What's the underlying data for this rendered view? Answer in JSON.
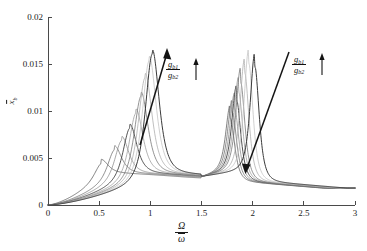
{
  "figure": {
    "title": "",
    "background_color": "#ffffff",
    "axis_color": "#4a4a4a"
  },
  "axes": {
    "x": {
      "label_numerator": "Ω",
      "label_denominator": "ω",
      "ticks": [
        "0",
        "0.5",
        "1",
        "1.5",
        "2",
        "2.5",
        "3"
      ],
      "tick_values": [
        0,
        0.5,
        1,
        1.5,
        2,
        2.5,
        3
      ],
      "min": 0,
      "max": 3
    },
    "y": {
      "label_base": "x",
      "label_sub": "b",
      "ticks": [
        "0",
        "0.005",
        "0.01",
        "0.015",
        "0.02"
      ],
      "tick_values": [
        0,
        0.005,
        0.01,
        0.015,
        0.02
      ],
      "min": 0,
      "max": 0.02
    }
  },
  "annotations": [
    {
      "id": "left-trend",
      "numerator": "g",
      "numerator_sub": "b1",
      "denominator": "g",
      "denominator_sub": "b2",
      "direction": "increasing",
      "arrow_glyph": "↑"
    },
    {
      "id": "right-trend",
      "numerator": "g",
      "numerator_sub": "b1",
      "denominator": "g",
      "denominator_sub": "b2",
      "direction": "increasing",
      "arrow_glyph": "↑"
    }
  ],
  "chart_data": {
    "type": "line",
    "title": "",
    "xlabel": "Ω/ω",
    "ylabel": "x̄_b",
    "xlim": [
      0,
      3
    ],
    "ylim": [
      0,
      0.02
    ],
    "grid": false,
    "legend": "none",
    "x": [
      0,
      0.1,
      0.2,
      0.3,
      0.4,
      0.5,
      0.6,
      0.7,
      0.8,
      0.9,
      1.0,
      1.1,
      1.2,
      1.3,
      1.4,
      1.5,
      1.6,
      1.7,
      1.8,
      1.9,
      2.0,
      2.1,
      2.2,
      2.3,
      2.4,
      2.5,
      2.6,
      2.7,
      2.8,
      2.9,
      3.0
    ],
    "series": [
      {
        "name": "g_b1/g_b2 = 1",
        "color": "#5a5a5a",
        "first_peak_x": 0.52,
        "first_peak_y": 0.00485,
        "second_peak_x": 1.78,
        "second_peak_y": 0.0093,
        "values": [
          0.0,
          0.0009,
          0.0019,
          0.0031,
          0.0042,
          0.00485,
          0.0047,
          0.0042,
          0.0038,
          0.0035,
          0.0033,
          0.0032,
          0.0031,
          0.0031,
          0.0031,
          0.0032,
          0.0035,
          0.0045,
          0.0093,
          0.0048,
          0.0031,
          0.0026,
          0.0023,
          0.0022,
          0.0021,
          0.002,
          0.002,
          0.0019,
          0.0019,
          0.0019,
          0.0018
        ]
      },
      {
        "name": "g_b1/g_b2 = 2",
        "color": "#6b6b6b",
        "first_peak_x": 0.65,
        "first_peak_y": 0.0063,
        "second_peak_x": 1.8,
        "second_peak_y": 0.0099,
        "values": [
          0.0,
          0.0007,
          0.0016,
          0.0026,
          0.0038,
          0.0051,
          0.0062,
          0.0056,
          0.0044,
          0.0037,
          0.0034,
          0.0033,
          0.0032,
          0.0031,
          0.0031,
          0.0032,
          0.0035,
          0.0046,
          0.0099,
          0.0047,
          0.003,
          0.0025,
          0.0023,
          0.0022,
          0.0021,
          0.002,
          0.002,
          0.0019,
          0.0019,
          0.0019,
          0.0018
        ]
      },
      {
        "name": "g_b1/g_b2 = 3",
        "color": "#8a8a8a",
        "first_peak_x": 0.72,
        "first_peak_y": 0.0073,
        "second_peak_x": 1.82,
        "second_peak_y": 0.0105,
        "values": [
          0.0,
          0.0006,
          0.0014,
          0.0024,
          0.0036,
          0.005,
          0.0065,
          0.0072,
          0.0052,
          0.004,
          0.0035,
          0.0033,
          0.0032,
          0.0031,
          0.0031,
          0.0032,
          0.0035,
          0.0047,
          0.0105,
          0.0046,
          0.003,
          0.0025,
          0.0023,
          0.0022,
          0.0021,
          0.002,
          0.002,
          0.0019,
          0.0019,
          0.0019,
          0.0018
        ]
      },
      {
        "name": "g_b1/g_b2 = 4",
        "color": "#4a4a4a",
        "first_peak_x": 0.8,
        "first_peak_y": 0.0086,
        "second_peak_x": 1.84,
        "second_peak_y": 0.0113,
        "values": [
          0.0,
          0.0005,
          0.0013,
          0.0022,
          0.0033,
          0.0047,
          0.0064,
          0.008,
          0.0085,
          0.0055,
          0.004,
          0.0035,
          0.0033,
          0.0032,
          0.0031,
          0.0032,
          0.0036,
          0.0048,
          0.0113,
          0.0045,
          0.0029,
          0.0025,
          0.0023,
          0.0021,
          0.0021,
          0.002,
          0.0019,
          0.0019,
          0.0019,
          0.0018,
          0.0018
        ]
      },
      {
        "name": "g_b1/g_b2 = 5",
        "color": "#9a9a9a",
        "first_peak_x": 0.86,
        "first_peak_y": 0.0102,
        "second_peak_x": 1.86,
        "second_peak_y": 0.0122,
        "values": [
          0.0,
          0.0005,
          0.0012,
          0.0021,
          0.0031,
          0.0044,
          0.0061,
          0.008,
          0.01,
          0.0072,
          0.0045,
          0.0037,
          0.0034,
          0.0032,
          0.0032,
          0.0033,
          0.0036,
          0.0049,
          0.0122,
          0.0044,
          0.0029,
          0.0025,
          0.0022,
          0.0021,
          0.0021,
          0.002,
          0.0019,
          0.0019,
          0.0019,
          0.0018,
          0.0018
        ]
      },
      {
        "name": "g_b1/g_b2 = 6",
        "color": "#707070",
        "first_peak_x": 0.91,
        "first_peak_y": 0.012,
        "second_peak_x": 1.88,
        "second_peak_y": 0.0132,
        "values": [
          0.0,
          0.0004,
          0.0011,
          0.0019,
          0.0029,
          0.0042,
          0.0058,
          0.0078,
          0.0103,
          0.0119,
          0.0056,
          0.004,
          0.0035,
          0.0033,
          0.0032,
          0.0033,
          0.0037,
          0.005,
          0.0132,
          0.0043,
          0.0029,
          0.0024,
          0.0022,
          0.0021,
          0.0021,
          0.002,
          0.0019,
          0.0019,
          0.0018,
          0.0018,
          0.0018
        ]
      },
      {
        "name": "g_b1/g_b2 = 7",
        "color": "#aaaaaa",
        "first_peak_x": 0.95,
        "first_peak_y": 0.014,
        "second_peak_x": 1.92,
        "second_peak_y": 0.0142,
        "values": [
          0.0,
          0.0004,
          0.001,
          0.0018,
          0.0028,
          0.004,
          0.0056,
          0.0076,
          0.0102,
          0.0136,
          0.0075,
          0.0043,
          0.0036,
          0.0033,
          0.0032,
          0.0033,
          0.0037,
          0.0051,
          0.0142,
          0.0042,
          0.0028,
          0.0024,
          0.0022,
          0.0021,
          0.002,
          0.002,
          0.0019,
          0.0019,
          0.0018,
          0.0018,
          0.0018
        ]
      },
      {
        "name": "g_b1/g_b2 = 8",
        "color": "#c0c0c0",
        "first_peak_x": 0.99,
        "first_peak_y": 0.0158,
        "second_peak_x": 1.96,
        "second_peak_y": 0.0152,
        "values": [
          0.0,
          0.0003,
          0.001,
          0.0017,
          0.0027,
          0.0039,
          0.0054,
          0.0074,
          0.01,
          0.014,
          0.012,
          0.0048,
          0.0037,
          0.0034,
          0.0033,
          0.0034,
          0.0038,
          0.0052,
          0.0152,
          0.0041,
          0.0028,
          0.0024,
          0.0022,
          0.0021,
          0.002,
          0.002,
          0.0019,
          0.0019,
          0.0018,
          0.0018,
          0.0018
        ]
      },
      {
        "name": "g_b1/g_b2 = 9",
        "color": "#2f2f2f",
        "first_peak_x": 1.02,
        "first_peak_y": 0.0165,
        "second_peak_x": 2.02,
        "second_peak_y": 0.0148,
        "values": [
          0.0,
          0.0003,
          0.0009,
          0.0016,
          0.0026,
          0.0038,
          0.0053,
          0.0072,
          0.0098,
          0.0143,
          0.0163,
          0.006,
          0.004,
          0.0035,
          0.0033,
          0.0034,
          0.0038,
          0.0053,
          0.0148,
          0.004,
          0.0027,
          0.0023,
          0.0022,
          0.0021,
          0.002,
          0.002,
          0.0019,
          0.0019,
          0.0018,
          0.0018,
          0.0018
        ]
      }
    ]
  }
}
